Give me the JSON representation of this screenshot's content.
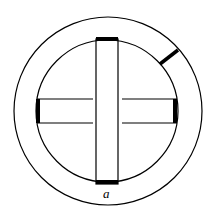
{
  "diagram": {
    "label_a": "a",
    "colors": {
      "stroke": "#000000",
      "background": "#ffffff"
    }
  }
}
